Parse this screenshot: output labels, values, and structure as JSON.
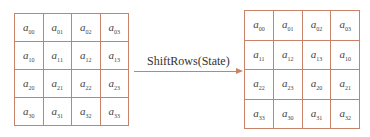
{
  "diagram": {
    "operation_label": "ShiftRows(State)",
    "line_color": "#c9826a",
    "input_state": {
      "rows": [
        [
          {
            "base": "a",
            "sub": "00"
          },
          {
            "base": "a",
            "sub": "01"
          },
          {
            "base": "a",
            "sub": "02"
          },
          {
            "base": "a",
            "sub": "03"
          }
        ],
        [
          {
            "base": "a",
            "sub": "10"
          },
          {
            "base": "a",
            "sub": "11"
          },
          {
            "base": "a",
            "sub": "12"
          },
          {
            "base": "a",
            "sub": "13"
          }
        ],
        [
          {
            "base": "a",
            "sub": "20"
          },
          {
            "base": "a",
            "sub": "21"
          },
          {
            "base": "a",
            "sub": "22"
          },
          {
            "base": "a",
            "sub": "23"
          }
        ],
        [
          {
            "base": "a",
            "sub": "30"
          },
          {
            "base": "a",
            "sub": "31"
          },
          {
            "base": "a",
            "sub": "32"
          },
          {
            "base": "a",
            "sub": "33"
          }
        ]
      ]
    },
    "output_state": {
      "rows": [
        [
          {
            "base": "a",
            "sub": "00"
          },
          {
            "base": "a",
            "sub": "01"
          },
          {
            "base": "a",
            "sub": "02"
          },
          {
            "base": "a",
            "sub": "03"
          }
        ],
        [
          {
            "base": "a",
            "sub": "11"
          },
          {
            "base": "a",
            "sub": "12"
          },
          {
            "base": "a",
            "sub": "13"
          },
          {
            "base": "a",
            "sub": "10"
          }
        ],
        [
          {
            "base": "a",
            "sub": "22"
          },
          {
            "base": "a",
            "sub": "23"
          },
          {
            "base": "a",
            "sub": "20"
          },
          {
            "base": "a",
            "sub": "21"
          }
        ],
        [
          {
            "base": "a",
            "sub": "33"
          },
          {
            "base": "a",
            "sub": "30"
          },
          {
            "base": "a",
            "sub": "31"
          },
          {
            "base": "a",
            "sub": "32"
          }
        ]
      ]
    }
  }
}
